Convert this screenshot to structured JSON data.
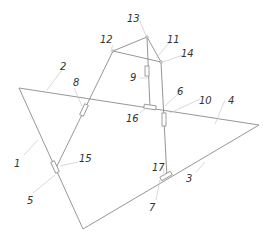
{
  "diagram": {
    "type": "mechanical-linkage-schematic",
    "labels": {
      "l1": "1",
      "l2": "2",
      "l3": "3",
      "l4": "4",
      "l5": "5",
      "l6": "6",
      "l7": "7",
      "l8": "8",
      "l9": "9",
      "l10": "10",
      "l11": "11",
      "l12": "12",
      "l13": "13",
      "l14": "14",
      "l15": "15",
      "l16": "16",
      "l17": "17"
    },
    "colors": {
      "line": "#8a8a8a",
      "leader": "#c8c8c8",
      "text": "#333333"
    }
  }
}
